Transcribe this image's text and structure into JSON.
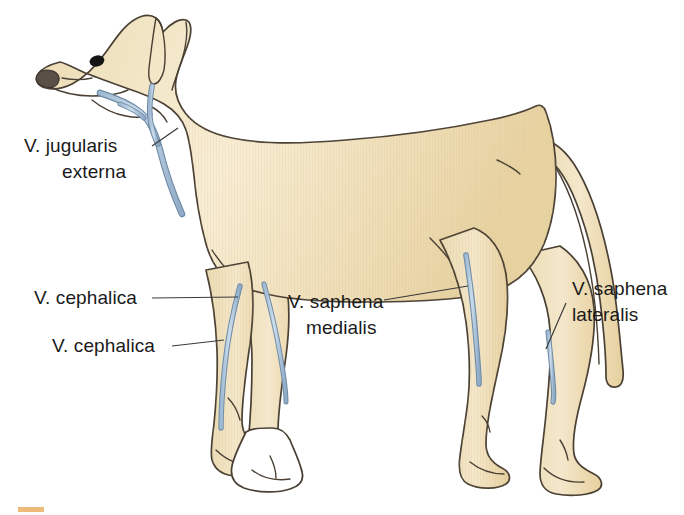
{
  "figure": {
    "background_color": "#ffffff"
  },
  "colors": {
    "body_fill_light": "#f6e8c8",
    "body_fill_mid": "#eddcb4",
    "body_fill_warm": "#e8d2a4",
    "outline": "#4a4034",
    "vein_fill": "#b9cee0",
    "vein_outline": "#6d8aa6",
    "label_text": "#1a1a1a",
    "leader_line": "#3b3b3b",
    "paw_white": "#ffffff",
    "nose": "#5a5048",
    "eye": "#141414",
    "caption_marker": "#e8a34a"
  },
  "labels": [
    {
      "id": "jugularis-externa",
      "line1": "V. jugularis",
      "line2": "externa",
      "text_x": 24,
      "text_y": 152,
      "align": "start",
      "line2_x": 62,
      "line2_y": 178,
      "leader": "M 152 145 L 176 130"
    },
    {
      "id": "cephalica-upper",
      "line1": "V. cephalica",
      "line2": "",
      "text_x": 34,
      "text_y": 304,
      "align": "start",
      "leader": "M 152 298 L 236 298"
    },
    {
      "id": "cephalica-lower",
      "line1": "V. cephalica",
      "line2": "",
      "text_x": 52,
      "text_y": 352,
      "align": "start",
      "leader": "M 170 346 L 222 341"
    },
    {
      "id": "saphena-medialis",
      "line1": "V. saphena",
      "line2": "medialis",
      "text_x": 288,
      "text_y": 308,
      "align": "start",
      "line2_x": 306,
      "line2_y": 334,
      "leader": "M 385 300 L 465 287"
    },
    {
      "id": "saphena-lateralis",
      "line1": "V. saphena",
      "line2": "lateralis",
      "text_x": 572,
      "text_y": 295,
      "align": "start",
      "line2_x": 572,
      "line2_y": 321,
      "leader": "M 568 302 L 545 348"
    }
  ],
  "veins": [
    {
      "id": "jugularis-externa-vein",
      "name": "V. jugularis externa"
    },
    {
      "id": "cephalica-near-vein",
      "name": "V. cephalica (near limb)"
    },
    {
      "id": "cephalica-far-vein",
      "name": "V. cephalica (far limb)"
    },
    {
      "id": "saphena-medialis-vein",
      "name": "V. saphena medialis"
    },
    {
      "id": "saphena-lateralis-vein",
      "name": "V. saphena lateralis"
    }
  ],
  "anatomy": {
    "ear": "cropped-ear",
    "nose": "muzzle-nose",
    "eye": "eye",
    "tail": "tail",
    "front_paw_near": "front-paw-near",
    "front_paw_far_white": "front-paw-far-unfilled",
    "hind_paw_near": "hind-paw-near",
    "hind_paw_far": "hind-paw-far"
  }
}
